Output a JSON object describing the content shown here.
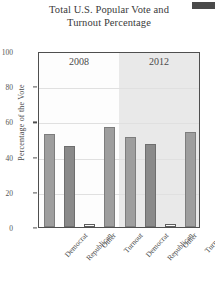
{
  "chart_data": {
    "type": "bar",
    "title": "Total U.S. Popular Vote and Turnout Percentage",
    "title_line1": "Total U.S. Popular Vote and",
    "title_line2": "Turnout Percentage",
    "xlabel": "",
    "ylabel": "Percentage of the Vote",
    "ylim": [
      0,
      100
    ],
    "yticks": [
      0,
      20,
      40,
      60,
      80,
      100
    ],
    "grid": true,
    "legend": "none",
    "group_labels": [
      "2008",
      "2012"
    ],
    "categories": [
      "Democrat",
      "Republican",
      "Other",
      "Turnout"
    ],
    "series": [
      {
        "name": "2008",
        "values": [
          53,
          46,
          1.5,
          57
        ]
      },
      {
        "name": "2012",
        "values": [
          51,
          47,
          1.7,
          54
        ]
      }
    ],
    "bars": [
      {
        "group": "2008",
        "category": "Democrat",
        "value": 53,
        "color": "#9e9e9e"
      },
      {
        "group": "2008",
        "category": "Republican",
        "value": 46,
        "color": "#8a8a8a"
      },
      {
        "group": "2008",
        "category": "Other",
        "value": 1.5,
        "color": "#fbfbfb"
      },
      {
        "group": "2008",
        "category": "Turnout",
        "value": 57,
        "color": "#9e9e9e"
      },
      {
        "group": "2012",
        "category": "Democrat",
        "value": 51,
        "color": "#9e9e9e"
      },
      {
        "group": "2012",
        "category": "Republican",
        "value": 47,
        "color": "#8a8a8a"
      },
      {
        "group": "2012",
        "category": "Other",
        "value": 1.7,
        "color": "#fbfbfb"
      },
      {
        "group": "2012",
        "category": "Turnout",
        "value": 54,
        "color": "#9e9e9e"
      }
    ],
    "tick_labels": {
      "t0": "0",
      "t20": "20",
      "t40": "40",
      "t60": "60",
      "t80": "80",
      "t100": "100"
    },
    "x_tick_labels": [
      "Democrat",
      "Republican",
      "Other",
      "Turnout",
      "Democrat",
      "Republican",
      "Other",
      "Turnout"
    ]
  },
  "colors": {
    "bar_light": "#9e9e9e",
    "bar_dark": "#8a8a8a",
    "bar_open": "#fbfbfb",
    "panel_shade": "#e9e9e9",
    "axis": "#4f4f4f",
    "text": "#3d3d3d"
  }
}
